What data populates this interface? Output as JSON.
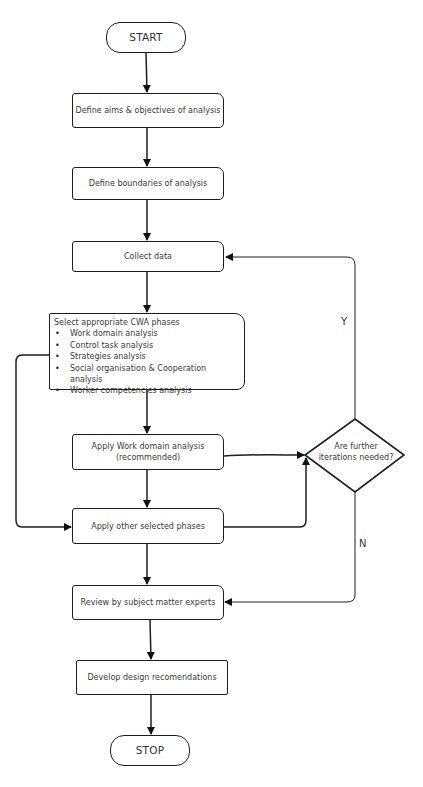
{
  "flowchart": {
    "start": "START",
    "stop": "STOP",
    "steps": {
      "define_aims": "Define aims & objectives of analysis",
      "define_boundaries": "Define boundaries of analysis",
      "collect_data": "Collect data",
      "select_phases": {
        "title": "Select appropriate CWA phases",
        "items": [
          "Work domain analysis",
          "Control task analysis",
          "Strategies analysis",
          "Social organisation & Cooperation analysis",
          "Worker competencies analysis"
        ]
      },
      "apply_wda": {
        "line1": "Apply Work domain analysis",
        "line2": "(recommended)"
      },
      "apply_other": "Apply other selected phases",
      "review": "Review by subject matter experts",
      "develop": "Develop design recomendations"
    },
    "decision": {
      "line1": "Are further",
      "line2": "iterations needed?"
    },
    "branch_labels": {
      "yes": "Y",
      "no": "N"
    },
    "colors": {
      "stroke": "#1e1e1e",
      "text": "#3a3a3a",
      "background": "#ffffff"
    }
  }
}
